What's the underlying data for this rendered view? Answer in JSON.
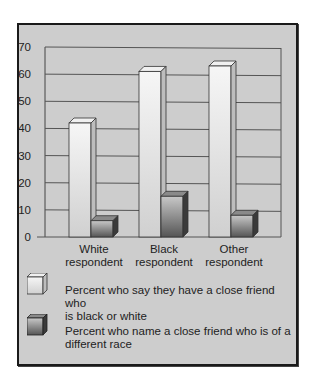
{
  "chart_data": {
    "type": "bar",
    "title": "",
    "xlabel": "",
    "ylabel": "",
    "ylim": [
      0,
      70
    ],
    "yticks": [
      0,
      10,
      20,
      30,
      40,
      50,
      60,
      70
    ],
    "grid": true,
    "style": "3d-bars",
    "categories": [
      "White respondent",
      "Black respondent",
      "Other respondent"
    ],
    "category_lines": [
      [
        "White",
        "respondent"
      ],
      [
        "Black",
        "respondent"
      ],
      [
        "Other",
        "respondent"
      ]
    ],
    "series": [
      {
        "name": "Percent who say they have a close friend who is black or white",
        "values": [
          42,
          61,
          63
        ],
        "color": "#e8e8e8"
      },
      {
        "name": "Percent who name a close friend who is of a different race",
        "values": [
          6,
          15,
          8
        ],
        "color": "#6a6a6a"
      }
    ],
    "legend_position": "bottom"
  },
  "legend": {
    "items": [
      {
        "lines": [
          "Percent who say they have a close friend who",
          "is black or white"
        ]
      },
      {
        "lines": [
          "Percent who name a close friend who is of a",
          "different race"
        ]
      }
    ]
  },
  "axis": {
    "y_ticks": [
      "70",
      "60",
      "50",
      "40",
      "30",
      "20",
      "10",
      "0"
    ]
  }
}
